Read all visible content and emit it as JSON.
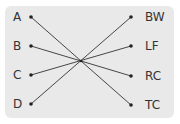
{
  "diagram": {
    "left_labels": [
      "A",
      "B",
      "C",
      "D"
    ],
    "right_labels": [
      "BW",
      "LF",
      "RC",
      "TC"
    ],
    "connections": [
      {
        "from": "A",
        "to": "TC"
      },
      {
        "from": "B",
        "to": "RC"
      },
      {
        "from": "C",
        "to": "LF"
      },
      {
        "from": "D",
        "to": "BW"
      }
    ],
    "colors": {
      "background": "#e9e9e9",
      "line": "#333333"
    }
  }
}
